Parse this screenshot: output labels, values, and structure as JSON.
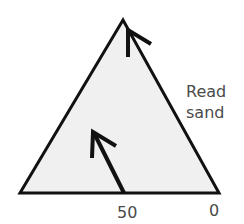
{
  "diagram": {
    "type": "ternary-triangle-reading-guide",
    "fill_color": "#f0f0f0",
    "stroke_color": "#111111",
    "label_color": "#4a4a4a",
    "side_label": [
      "Read",
      "sand"
    ],
    "axis_ticks": [
      {
        "label": "50",
        "position": "base-middle"
      },
      {
        "label": "0",
        "position": "base-right"
      }
    ],
    "arrows": [
      {
        "name": "reading-arrow-at-50",
        "from": "base 50",
        "direction": "parallel to right side"
      },
      {
        "name": "reading-arrow-at-apex",
        "from": "right side near apex",
        "direction": "upward"
      }
    ]
  }
}
